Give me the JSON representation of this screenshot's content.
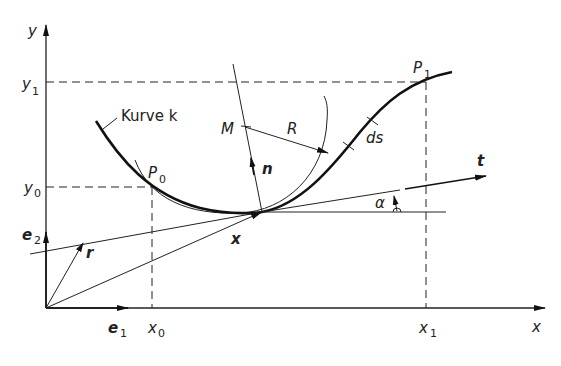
{
  "figure": {
    "colors": {
      "ink": "#222222",
      "background": "#ffffff"
    },
    "axes": {
      "x_label": "x",
      "y_label": "y",
      "x_ticks": [
        {
          "main": "x",
          "sub": "0"
        },
        {
          "main": "x",
          "sub": "1"
        }
      ],
      "y_ticks": [
        {
          "main": "y",
          "sub": "1"
        },
        {
          "main": "y",
          "sub": "0"
        }
      ]
    },
    "unit_vectors": {
      "e1": {
        "main": "e",
        "sub": "1"
      },
      "e2": {
        "main": "e",
        "sub": "2"
      }
    },
    "labels": {
      "curve": "Kurve k",
      "p0": {
        "main": "P",
        "sub": "0"
      },
      "p1": {
        "main": "P",
        "sub": "1"
      },
      "center": "M",
      "radius": "R",
      "arc_element": "ds",
      "normal": "n",
      "tangent": "t",
      "position": "x",
      "r_vector": "r",
      "angle": "α"
    }
  }
}
